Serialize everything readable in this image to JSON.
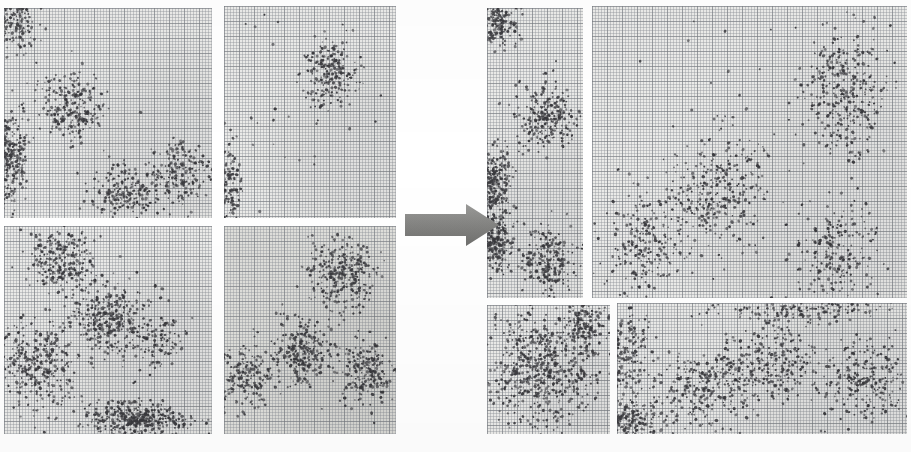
{
  "figure": {
    "title": "Cluster scatter plots before and after transformation",
    "caption": "",
    "background_color": "#ffffff",
    "paper_color": "#ebebe9",
    "grid_line_color": "#787c82",
    "dot_color": "#3b3b3f",
    "arrow": {
      "name": "transition-arrow",
      "direction": "right",
      "color": "#8a8a88",
      "label": ""
    }
  },
  "groups": [
    {
      "id": "left",
      "name": "input-panel-group",
      "label": ""
    },
    {
      "id": "right",
      "name": "output-panel-group",
      "label": ""
    }
  ],
  "chart_data": {
    "type": "scatter",
    "title": "Cluster scatter plots before and after transformation",
    "xlabel": "",
    "ylabel": "",
    "xlim": [
      0,
      1
    ],
    "ylim": [
      0,
      1
    ],
    "grid": true,
    "legend": null,
    "annotations": [
      {
        "text": "",
        "kind": "block-arrow",
        "from_group": "left",
        "to_group": "right"
      }
    ],
    "panels": [
      {
        "id": "L1",
        "name": "panel-left-top-left",
        "group": "left",
        "rect": [
          4,
          8,
          208,
          210
        ],
        "shade": "light",
        "clusters": [
          {
            "name": "corner-top-left",
            "cx": 0.05,
            "cy": 0.05,
            "sx": 0.055,
            "sy": 0.075,
            "n": 190
          },
          {
            "name": "edge-left-lower",
            "cx": 0.02,
            "cy": 0.7,
            "sx": 0.045,
            "sy": 0.115,
            "n": 300
          },
          {
            "name": "center-upper",
            "cx": 0.33,
            "cy": 0.47,
            "sx": 0.085,
            "sy": 0.08,
            "n": 230
          },
          {
            "name": "bottom-middle",
            "cx": 0.58,
            "cy": 0.88,
            "sx": 0.085,
            "sy": 0.065,
            "n": 200
          },
          {
            "name": "bottom-right",
            "cx": 0.84,
            "cy": 0.79,
            "sx": 0.07,
            "sy": 0.075,
            "n": 175
          }
        ]
      },
      {
        "id": "L2",
        "name": "panel-left-top-right",
        "group": "left",
        "rect": [
          224,
          6,
          172,
          212
        ],
        "shade": "light",
        "clusters": [
          {
            "name": "upper-centre",
            "cx": 0.62,
            "cy": 0.31,
            "sx": 0.08,
            "sy": 0.085,
            "n": 215
          },
          {
            "name": "edge-left",
            "cx": 0.02,
            "cy": 0.86,
            "sx": 0.04,
            "sy": 0.11,
            "n": 150
          },
          {
            "name": "sparse-noise",
            "cx": 0.45,
            "cy": 0.55,
            "sx": 0.32,
            "sy": 0.3,
            "n": 25
          }
        ]
      },
      {
        "id": "L3",
        "name": "panel-left-bottom-left",
        "group": "left",
        "rect": [
          4,
          226,
          208,
          208
        ],
        "shade": "light",
        "clusters": [
          {
            "name": "upper-left",
            "cx": 0.27,
            "cy": 0.16,
            "sx": 0.085,
            "sy": 0.075,
            "n": 240
          },
          {
            "name": "centre-diagonal",
            "cx": 0.5,
            "cy": 0.44,
            "sx": 0.095,
            "sy": 0.09,
            "n": 330
          },
          {
            "name": "left-lower",
            "cx": 0.16,
            "cy": 0.68,
            "sx": 0.09,
            "sy": 0.11,
            "n": 330
          },
          {
            "name": "bottom-band",
            "cx": 0.62,
            "cy": 0.93,
            "sx": 0.13,
            "sy": 0.04,
            "n": 360
          },
          {
            "name": "right-mid",
            "cx": 0.72,
            "cy": 0.56,
            "sx": 0.075,
            "sy": 0.08,
            "n": 120
          }
        ]
      },
      {
        "id": "L4",
        "name": "panel-left-bottom-right",
        "group": "left",
        "rect": [
          224,
          226,
          172,
          208
        ],
        "shade": "dark",
        "clusters": [
          {
            "name": "upper-right",
            "cx": 0.68,
            "cy": 0.23,
            "sx": 0.09,
            "sy": 0.085,
            "n": 300
          },
          {
            "name": "centre",
            "cx": 0.46,
            "cy": 0.6,
            "sx": 0.085,
            "sy": 0.08,
            "n": 260
          },
          {
            "name": "left-lower",
            "cx": 0.12,
            "cy": 0.72,
            "sx": 0.08,
            "sy": 0.075,
            "n": 200
          },
          {
            "name": "right-lower",
            "cx": 0.83,
            "cy": 0.7,
            "sx": 0.075,
            "sy": 0.08,
            "n": 215
          }
        ]
      },
      {
        "id": "R1",
        "name": "panel-right-top-left",
        "group": "right",
        "rect": [
          487,
          8,
          96,
          290
        ],
        "shade": "light",
        "clusters": [
          {
            "name": "corner-top-left",
            "cx": 0.12,
            "cy": 0.05,
            "sx": 0.11,
            "sy": 0.042,
            "n": 170
          },
          {
            "name": "mid-cluster",
            "cx": 0.62,
            "cy": 0.38,
            "sx": 0.15,
            "sy": 0.06,
            "n": 245
          },
          {
            "name": "left-band",
            "cx": 0.05,
            "cy": 0.6,
            "sx": 0.09,
            "sy": 0.06,
            "n": 300
          },
          {
            "name": "lower-left",
            "cx": 0.1,
            "cy": 0.8,
            "sx": 0.095,
            "sy": 0.055,
            "n": 230
          },
          {
            "name": "lower-right",
            "cx": 0.62,
            "cy": 0.87,
            "sx": 0.15,
            "sy": 0.055,
            "n": 230
          }
        ]
      },
      {
        "id": "R2",
        "name": "panel-right-top-right",
        "group": "right",
        "rect": [
          592,
          6,
          315,
          292
        ],
        "shade": "light",
        "clusters": [
          {
            "name": "upper-right",
            "cx": 0.81,
            "cy": 0.3,
            "sx": 0.068,
            "sy": 0.11,
            "n": 330
          },
          {
            "name": "centre-left",
            "cx": 0.4,
            "cy": 0.63,
            "sx": 0.075,
            "sy": 0.095,
            "n": 300
          },
          {
            "name": "lower-left",
            "cx": 0.17,
            "cy": 0.82,
            "sx": 0.07,
            "sy": 0.09,
            "n": 230
          },
          {
            "name": "lower-right",
            "cx": 0.78,
            "cy": 0.86,
            "sx": 0.07,
            "sy": 0.09,
            "n": 220
          },
          {
            "name": "sparse-noise",
            "cx": 0.5,
            "cy": 0.4,
            "sx": 0.33,
            "sy": 0.26,
            "n": 30
          }
        ]
      },
      {
        "id": "R3",
        "name": "panel-right-bottom-left",
        "group": "right",
        "rect": [
          487,
          305,
          123,
          129
        ],
        "shade": "light",
        "clusters": [
          {
            "name": "main-blob",
            "cx": 0.45,
            "cy": 0.5,
            "sx": 0.23,
            "sy": 0.23,
            "n": 620
          },
          {
            "name": "top-right",
            "cx": 0.78,
            "cy": 0.17,
            "sx": 0.11,
            "sy": 0.09,
            "n": 150
          }
        ]
      },
      {
        "id": "R4",
        "name": "panel-right-bottom-right",
        "group": "right",
        "rect": [
          617,
          303,
          290,
          131
        ],
        "shade": "light",
        "clusters": [
          {
            "name": "left-edge",
            "cx": 0.03,
            "cy": 0.42,
            "sx": 0.045,
            "sy": 0.19,
            "n": 190
          },
          {
            "name": "bottom-left",
            "cx": 0.04,
            "cy": 0.9,
            "sx": 0.05,
            "sy": 0.075,
            "n": 200
          },
          {
            "name": "centre-left",
            "cx": 0.3,
            "cy": 0.66,
            "sx": 0.085,
            "sy": 0.14,
            "n": 260
          },
          {
            "name": "centre-right",
            "cx": 0.53,
            "cy": 0.45,
            "sx": 0.08,
            "sy": 0.15,
            "n": 260
          },
          {
            "name": "top-band",
            "cx": 0.62,
            "cy": 0.06,
            "sx": 0.15,
            "sy": 0.045,
            "n": 140
          },
          {
            "name": "right-blob",
            "cx": 0.85,
            "cy": 0.58,
            "sx": 0.075,
            "sy": 0.175,
            "n": 240
          }
        ]
      }
    ]
  }
}
